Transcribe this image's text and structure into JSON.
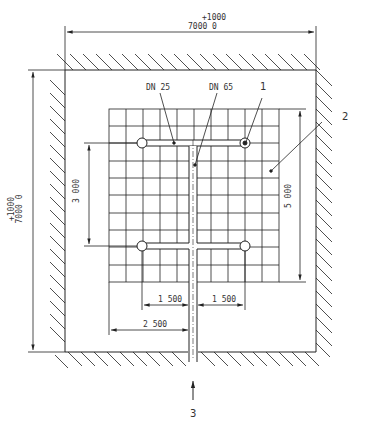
{
  "diagram": {
    "room_width": {
      "value": "7000 0",
      "tolerance": "+1000"
    },
    "room_length": {
      "value": "7000 0",
      "tolerance": "+1000"
    },
    "pipe_labels": {
      "branch": "DN 25",
      "main": "DN 65"
    },
    "dimensions": {
      "sprinkler_row_spacing": "3 000",
      "grid_length": "5 000",
      "left_offset": "1 500",
      "right_offset": "1 500",
      "wall_to_main": "2 500"
    },
    "callouts": {
      "sprinkler": "1",
      "grid": "2",
      "supply": "3"
    },
    "colors": {
      "line": "#222222",
      "background": "#ffffff"
    }
  }
}
